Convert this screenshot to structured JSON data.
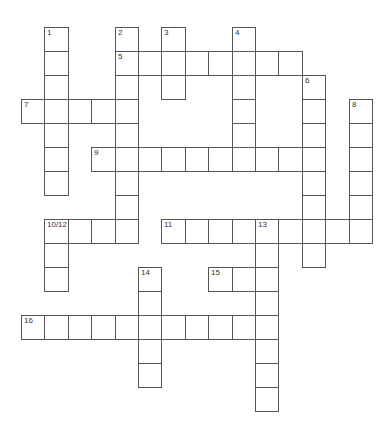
{
  "puzzle": {
    "type": "crossword",
    "grid": {
      "origin_x": 21,
      "origin_y": 27,
      "cell_width": 23.4,
      "cell_height": 24,
      "line_color": "#555555",
      "fill_color": "#ffffff"
    },
    "words": [
      {
        "label": "1",
        "number": 1,
        "direction": "down",
        "row": 0,
        "col": 1,
        "length": 7
      },
      {
        "label": "2",
        "number": 2,
        "direction": "down",
        "row": 0,
        "col": 4,
        "length": 9
      },
      {
        "label": "3",
        "number": 3,
        "direction": "down",
        "row": 0,
        "col": 6,
        "length": 3
      },
      {
        "label": "4",
        "number": 4,
        "direction": "down",
        "row": 0,
        "col": 9,
        "length": 6
      },
      {
        "label": "5",
        "number": 5,
        "direction": "across",
        "row": 1,
        "col": 4,
        "length": 8
      },
      {
        "label": "6",
        "number": 6,
        "direction": "down",
        "row": 2,
        "col": 12,
        "length": 8
      },
      {
        "label": "7",
        "number": 7,
        "direction": "across",
        "row": 3,
        "col": 0,
        "length": 5
      },
      {
        "label": "8",
        "number": 8,
        "direction": "down",
        "row": 3,
        "col": 14,
        "length": 6
      },
      {
        "label": "9",
        "number": 9,
        "direction": "across",
        "row": 5,
        "col": 3,
        "length": 10
      },
      {
        "label": "10/12",
        "number": 10,
        "direction": "across",
        "row": 8,
        "col": 1,
        "length": 4
      },
      {
        "label": "11",
        "number": 11,
        "direction": "across",
        "row": 8,
        "col": 6,
        "length": 9
      },
      {
        "label": "",
        "number": 12,
        "direction": "down",
        "row": 8,
        "col": 1,
        "length": 3
      },
      {
        "label": "13",
        "number": 13,
        "direction": "down",
        "row": 8,
        "col": 10,
        "length": 8
      },
      {
        "label": "14",
        "number": 14,
        "direction": "down",
        "row": 10,
        "col": 5,
        "length": 5
      },
      {
        "label": "15",
        "number": 15,
        "direction": "across",
        "row": 10,
        "col": 8,
        "length": 3
      },
      {
        "label": "16",
        "number": 16,
        "direction": "across",
        "row": 12,
        "col": 0,
        "length": 11
      }
    ],
    "answers": {}
  }
}
